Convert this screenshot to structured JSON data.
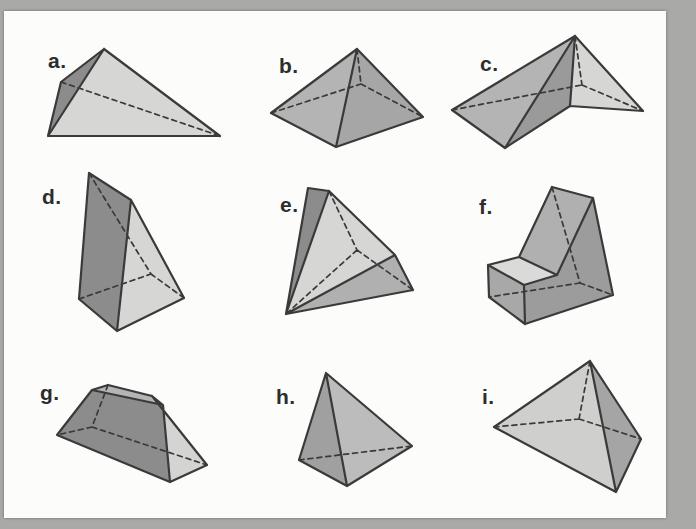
{
  "page": {
    "background_color": "#a9a9a7",
    "card_color": "#fcfcfb",
    "stroke_color": "#3a3a3a",
    "label_color": "#2d2d2d",
    "solid_stroke_width": 2.2,
    "dashed_stroke_width": 1.7,
    "dash_pattern": "5 4"
  },
  "figures": [
    {
      "id": "a",
      "label": "a.",
      "label_pos": [
        48,
        50
      ],
      "faces": [
        {
          "fill": "#8c8c8c",
          "pts": [
            [
              104,
              49
            ],
            [
              61,
              82
            ],
            [
              48,
              136
            ]
          ]
        },
        {
          "fill": "#d6d6d4",
          "pts": [
            [
              104,
              49
            ],
            [
              48,
              136
            ],
            [
              220,
              136
            ]
          ]
        }
      ],
      "solid": [
        [
          104,
          49,
          61,
          82
        ],
        [
          61,
          82,
          48,
          136
        ],
        [
          48,
          136,
          220,
          136
        ],
        [
          220,
          136,
          104,
          49
        ],
        [
          104,
          49,
          48,
          136
        ]
      ],
      "dashed": [
        [
          61,
          82,
          220,
          136
        ]
      ]
    },
    {
      "id": "b",
      "label": "b.",
      "label_pos": [
        279,
        55
      ],
      "faces": [
        {
          "fill": "#b4b4b4",
          "pts": [
            [
              357,
              49
            ],
            [
              271,
              113
            ],
            [
              336,
              147
            ]
          ]
        },
        {
          "fill": "#a6a6a6",
          "pts": [
            [
              357,
              49
            ],
            [
              336,
              147
            ],
            [
              423,
              117
            ]
          ]
        }
      ],
      "solid": [
        [
          357,
          49,
          271,
          113
        ],
        [
          357,
          49,
          336,
          147
        ],
        [
          357,
          49,
          423,
          117
        ],
        [
          271,
          113,
          336,
          147
        ],
        [
          336,
          147,
          423,
          117
        ]
      ],
      "dashed": [
        [
          271,
          113,
          361,
          84
        ],
        [
          361,
          84,
          423,
          117
        ],
        [
          357,
          49,
          361,
          84
        ]
      ]
    },
    {
      "id": "c",
      "label": "c.",
      "label_pos": [
        480,
        53
      ],
      "faces": [
        {
          "fill": "#b4b4b4",
          "pts": [
            [
              575,
              36
            ],
            [
              452,
              110
            ],
            [
              505,
              148
            ]
          ]
        },
        {
          "fill": "#9a9a9a",
          "pts": [
            [
              575,
              36
            ],
            [
              505,
              148
            ],
            [
              570,
              106
            ]
          ]
        },
        {
          "fill": "#d6d6d4",
          "pts": [
            [
              575,
              36
            ],
            [
              570,
              106
            ],
            [
              643,
              111
            ]
          ]
        }
      ],
      "solid": [
        [
          575,
          36,
          452,
          110
        ],
        [
          452,
          110,
          505,
          148
        ],
        [
          505,
          148,
          575,
          36
        ],
        [
          505,
          148,
          570,
          106
        ],
        [
          570,
          106,
          575,
          36
        ],
        [
          570,
          106,
          643,
          111
        ],
        [
          643,
          111,
          575,
          36
        ]
      ],
      "dashed": [
        [
          452,
          110,
          582,
          85
        ],
        [
          582,
          85,
          643,
          111
        ],
        [
          575,
          36,
          582,
          85
        ]
      ]
    },
    {
      "id": "d",
      "label": "d.",
      "label_pos": [
        42,
        186
      ],
      "faces": [
        {
          "fill": "#8c8c8c",
          "pts": [
            [
              89,
              173
            ],
            [
              131,
              200
            ],
            [
              117,
              331
            ],
            [
              79,
              299
            ]
          ]
        },
        {
          "fill": "#d6d6d4",
          "pts": [
            [
              131,
              200
            ],
            [
              184,
              298
            ],
            [
              117,
              331
            ]
          ]
        }
      ],
      "solid": [
        [
          89,
          173,
          131,
          200
        ],
        [
          89,
          173,
          79,
          299
        ],
        [
          131,
          200,
          117,
          331
        ],
        [
          131,
          200,
          184,
          298
        ],
        [
          79,
          299,
          117,
          331
        ],
        [
          117,
          331,
          184,
          298
        ]
      ],
      "dashed": [
        [
          89,
          173,
          151,
          274
        ],
        [
          79,
          299,
          151,
          274
        ],
        [
          184,
          298,
          151,
          274
        ]
      ]
    },
    {
      "id": "e",
      "label": "e.",
      "label_pos": [
        280,
        194
      ],
      "faces": [
        {
          "fill": "#8c8c8c",
          "pts": [
            [
              308,
              188
            ],
            [
              329,
              191
            ],
            [
              286,
              314
            ]
          ]
        },
        {
          "fill": "#d6d6d4",
          "pts": [
            [
              329,
              191
            ],
            [
              395,
              255
            ],
            [
              286,
              314
            ]
          ]
        },
        {
          "fill": "#b0b0b0",
          "pts": [
            [
              395,
              255
            ],
            [
              413,
              290
            ],
            [
              286,
              314
            ]
          ]
        }
      ],
      "solid": [
        [
          308,
          188,
          329,
          191
        ],
        [
          308,
          188,
          286,
          314
        ],
        [
          329,
          191,
          286,
          314
        ],
        [
          329,
          191,
          395,
          255
        ],
        [
          395,
          255,
          286,
          314
        ],
        [
          395,
          255,
          413,
          290
        ],
        [
          413,
          290,
          286,
          314
        ]
      ],
      "dashed": [
        [
          329,
          191,
          357,
          250
        ],
        [
          357,
          250,
          286,
          314
        ],
        [
          357,
          250,
          413,
          290
        ]
      ]
    },
    {
      "id": "f",
      "label": "f.",
      "label_pos": [
        479,
        196
      ],
      "faces": [
        {
          "fill": "#9c9c9c",
          "pts": [
            [
              593,
              198
            ],
            [
              613,
              295
            ],
            [
              525,
              324
            ],
            [
              524,
              285
            ],
            [
              557,
              275
            ]
          ]
        },
        {
          "fill": "#b0b0b0",
          "pts": [
            [
              552,
              187
            ],
            [
              593,
              198
            ],
            [
              557,
              275
            ],
            [
              519,
              257
            ]
          ]
        },
        {
          "fill": "#dadad8",
          "pts": [
            [
              488,
              265
            ],
            [
              519,
              257
            ],
            [
              557,
              275
            ],
            [
              524,
              285
            ]
          ]
        },
        {
          "fill": "#a8a8a8",
          "pts": [
            [
              488,
              265
            ],
            [
              524,
              285
            ],
            [
              525,
              324
            ],
            [
              489,
              297
            ]
          ]
        }
      ],
      "solid": [
        [
          552,
          187,
          593,
          198
        ],
        [
          552,
          187,
          519,
          257
        ],
        [
          593,
          198,
          557,
          275
        ],
        [
          593,
          198,
          613,
          295
        ],
        [
          519,
          257,
          557,
          275
        ],
        [
          557,
          275,
          524,
          285
        ],
        [
          613,
          295,
          525,
          324
        ],
        [
          525,
          324,
          524,
          285
        ],
        [
          525,
          324,
          489,
          297
        ],
        [
          524,
          285,
          488,
          265
        ],
        [
          488,
          265,
          519,
          257
        ],
        [
          488,
          265,
          489,
          297
        ]
      ],
      "dashed": [
        [
          552,
          187,
          580,
          283
        ],
        [
          580,
          283,
          489,
          297
        ],
        [
          580,
          283,
          613,
          295
        ]
      ]
    },
    {
      "id": "g",
      "label": "g.",
      "label_pos": [
        40,
        382
      ],
      "faces": [
        {
          "fill": "#8c8c8c",
          "pts": [
            [
              57,
              435
            ],
            [
              92,
              390
            ],
            [
              163,
              405
            ],
            [
              170,
              482
            ]
          ]
        },
        {
          "fill": "#b5b5b5",
          "pts": [
            [
              92,
              390
            ],
            [
              108,
              385
            ],
            [
              152,
              396
            ],
            [
              163,
              405
            ]
          ]
        },
        {
          "fill": "#d4d4d2",
          "pts": [
            [
              152,
              396
            ],
            [
              163,
              405
            ],
            [
              170,
              482
            ],
            [
              207,
              465
            ]
          ]
        }
      ],
      "solid": [
        [
          57,
          435,
          92,
          390
        ],
        [
          92,
          390,
          108,
          385
        ],
        [
          108,
          385,
          152,
          396
        ],
        [
          152,
          396,
          163,
          405
        ],
        [
          92,
          390,
          163,
          405
        ],
        [
          163,
          405,
          170,
          482
        ],
        [
          57,
          435,
          170,
          482
        ],
        [
          152,
          396,
          207,
          465
        ],
        [
          170,
          482,
          207,
          465
        ]
      ],
      "dashed": [
        [
          108,
          385,
          92,
          427
        ],
        [
          92,
          427,
          57,
          435
        ],
        [
          92,
          427,
          207,
          465
        ]
      ]
    },
    {
      "id": "h",
      "label": "h.",
      "label_pos": [
        276,
        386
      ],
      "faces": [
        {
          "fill": "#a0a0a0",
          "pts": [
            [
              326,
              373
            ],
            [
              299,
              460
            ],
            [
              347,
              486
            ]
          ]
        },
        {
          "fill": "#bcbcbc",
          "pts": [
            [
              326,
              373
            ],
            [
              347,
              486
            ],
            [
              412,
              446
            ]
          ]
        }
      ],
      "solid": [
        [
          326,
          373,
          299,
          460
        ],
        [
          326,
          373,
          347,
          486
        ],
        [
          326,
          373,
          412,
          446
        ],
        [
          299,
          460,
          347,
          486
        ],
        [
          347,
          486,
          412,
          446
        ]
      ],
      "dashed": [
        [
          299,
          460,
          412,
          446
        ]
      ]
    },
    {
      "id": "i",
      "label": "i.",
      "label_pos": [
        482,
        386
      ],
      "faces": [
        {
          "fill": "#cfcfcd",
          "pts": [
            [
              590,
              361
            ],
            [
              494,
              427
            ],
            [
              616,
              492
            ]
          ]
        },
        {
          "fill": "#a5a5a5",
          "pts": [
            [
              590,
              361
            ],
            [
              616,
              492
            ],
            [
              641,
              439
            ]
          ]
        }
      ],
      "solid": [
        [
          590,
          361,
          494,
          427
        ],
        [
          494,
          427,
          616,
          492
        ],
        [
          616,
          492,
          641,
          439
        ],
        [
          641,
          439,
          590,
          361
        ],
        [
          590,
          361,
          616,
          492
        ]
      ],
      "dashed": [
        [
          590,
          361,
          579,
          419
        ],
        [
          494,
          427,
          579,
          419
        ],
        [
          579,
          419,
          641,
          439
        ]
      ]
    }
  ]
}
